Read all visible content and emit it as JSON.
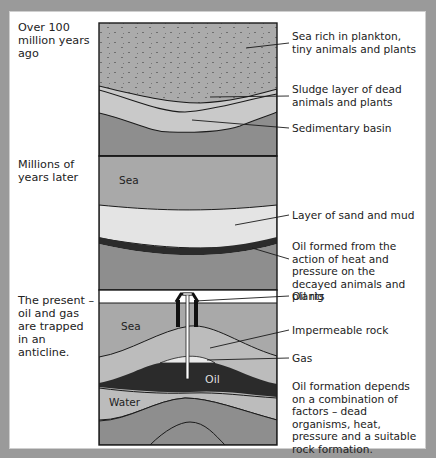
{
  "stages": [
    {
      "id": "stage-1",
      "label": "Over 100 million years ago"
    },
    {
      "id": "stage-2",
      "label": "Millions of years later"
    },
    {
      "id": "stage-3",
      "label": "The present – oil and gas are trapped in an anticline."
    }
  ],
  "callouts": [
    {
      "id": "plankton",
      "text": "Sea rich in plankton, tiny animals and plants"
    },
    {
      "id": "sludge",
      "text": "Sludge layer of dead animals and plants"
    },
    {
      "id": "basin",
      "text": "Sedimentary basin"
    },
    {
      "id": "sand-mud",
      "text": "Layer of sand and mud"
    },
    {
      "id": "oil-formed",
      "text": "Oil formed from the action of heat and pressure on the decayed animals and plants"
    },
    {
      "id": "oil-rig",
      "text": "Oil rig"
    },
    {
      "id": "impermeable",
      "text": "Impermeable rock"
    },
    {
      "id": "gas",
      "text": "Gas"
    },
    {
      "id": "summary",
      "text": "Oil formation depends on a combination of factors – dead organisms, heat, pressure and a suitable rock formation."
    }
  ],
  "in_diagram_labels": {
    "sea_2": "Sea",
    "sea_3": "Sea",
    "oil": "Oil",
    "water": "Water"
  },
  "colors": {
    "background": "#9a9a9a",
    "panel": "#ffffff",
    "sea": "#a9a9a9",
    "sludge": "#c9c9c9",
    "sand": "#e4e4e4",
    "rock_dark": "#8c8c8c",
    "oil": "#2b2b2b",
    "gas": "#e9e9e9",
    "outline": "#1a1a1a"
  }
}
